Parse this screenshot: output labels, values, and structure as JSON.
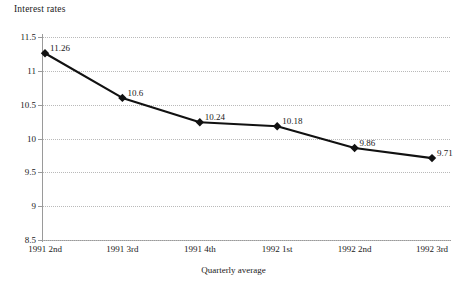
{
  "chart_data": {
    "type": "line",
    "title": "Interest rates",
    "xlabel": "Quarterly average",
    "ylabel": "",
    "categories": [
      "1991 2nd",
      "1991 3rd",
      "1991 4th",
      "1992 1st",
      "1992 2nd",
      "1992 3rd"
    ],
    "values": [
      11.26,
      10.6,
      10.24,
      10.18,
      9.86,
      9.71
    ],
    "point_labels": [
      "11.26",
      "10.6",
      "10.24",
      "10.18",
      "9.86",
      "9.71"
    ],
    "ylim": [
      8.5,
      11.5
    ],
    "yticks": [
      11.5,
      11,
      10.5,
      10,
      9.5,
      9,
      8.5
    ],
    "ytick_labels": [
      "11.5",
      "11",
      "10.5",
      "10",
      "9.5",
      "9",
      "8.5"
    ],
    "grid": true,
    "grid_style": "dotted",
    "grid_color": "#b9b9b9",
    "legend": "none",
    "series_color": "#111111",
    "marker": "diamond",
    "background": "#ffffff",
    "axis_color": "#9a9a9a"
  }
}
